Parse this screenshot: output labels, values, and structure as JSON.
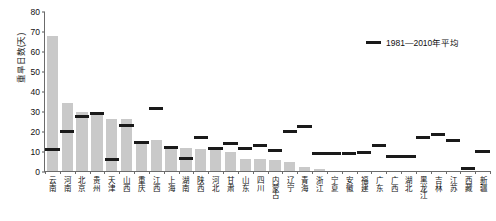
{
  "chart_data": {
    "type": "bar",
    "title": "",
    "xlabel": "",
    "ylabel": "重旱日数(天)",
    "ylim": [
      0,
      80
    ],
    "yticks": [
      0,
      10,
      20,
      30,
      40,
      50,
      60,
      70,
      80
    ],
    "grid": false,
    "legend_position": "top-right",
    "legend": [
      {
        "name": "1981—2010年平均",
        "marker": "dash",
        "color": "#1a1a1a"
      }
    ],
    "categories": [
      "云南",
      "河南",
      "北京",
      "贵州",
      "天津",
      "山西",
      "重庆",
      "江西",
      "上海",
      "湖南",
      "陕西",
      "河北",
      "甘肃",
      "山东",
      "四川",
      "内蒙古",
      "辽宁",
      "青海",
      "浙江",
      "宁夏",
      "安徽",
      "福建",
      "广东",
      "广西",
      "湖北",
      "黑龙江",
      "吉林",
      "江苏",
      "西藏",
      "新疆"
    ],
    "series": [
      {
        "name": "重旱日数",
        "type": "bar",
        "color": "#c9c9c9",
        "values": [
          67.5,
          34.0,
          29.5,
          29.0,
          26.0,
          25.8,
          14.8,
          15.5,
          11.8,
          11.6,
          10.8,
          11.0,
          9.3,
          6.2,
          6.0,
          5.6,
          4.6,
          2.2,
          0.9,
          0.0,
          0.0,
          0.0,
          0.0,
          0.0,
          0.0,
          0.0,
          0.0,
          0.0,
          0.0,
          0.0
        ]
      },
      {
        "name": "1981—2010年平均",
        "type": "marker",
        "color": "#1a1a1a",
        "values": [
          11.0,
          20.0,
          27.5,
          29.0,
          6.0,
          23.0,
          14.5,
          31.5,
          11.7,
          6.3,
          16.7,
          11.3,
          14.0,
          11.5,
          12.8,
          10.3,
          19.8,
          22.3,
          8.8,
          8.9,
          8.7,
          9.4,
          12.7,
          7.3,
          7.3,
          16.8,
          18.5,
          15.3,
          1.5,
          9.8
        ]
      }
    ]
  }
}
